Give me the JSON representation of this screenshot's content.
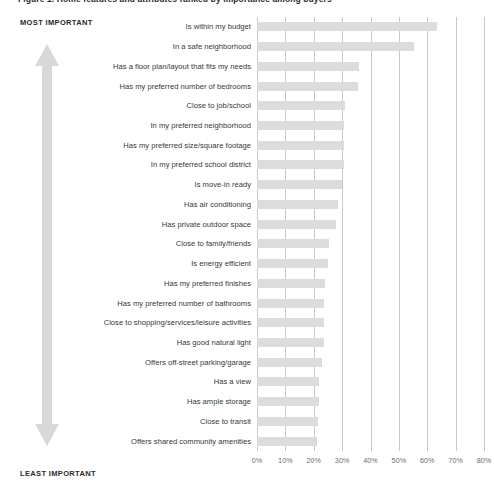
{
  "chart_title": "Figure 1. Home features and attributes ranked by importance among buyers",
  "importance_axis": {
    "top_label": "MOST IMPORTANT",
    "bottom_label": "LEAST IMPORTANT",
    "arrow_icon": "double-headed-vertical-arrow-icon",
    "arrow_color": "#d8d8d8"
  },
  "style": {
    "bar_color": "#dcdcdc",
    "gridline_color": "#c9c9c9",
    "label_color": "#33373b",
    "tick_color": "#6d6d6d",
    "background": "#ffffff"
  },
  "chart_data": {
    "type": "bar",
    "orientation": "horizontal",
    "title": "Figure 1. Home features and attributes ranked by importance among buyers",
    "xlabel": "",
    "ylabel": "",
    "xlim": [
      0,
      80
    ],
    "xticks": [
      0,
      10,
      20,
      30,
      40,
      50,
      60,
      70,
      80
    ],
    "xtick_labels": [
      "0%",
      "10%",
      "20%",
      "30%",
      "40%",
      "50%",
      "60%",
      "70%",
      "80%"
    ],
    "grid": true,
    "legend": false,
    "value_unit": "%",
    "sorted": "descending",
    "categories": [
      "Is within my budget",
      "In a safe neighborhood",
      "Has a floor plan/layout that fits my needs",
      "Has my preferred number of bedrooms",
      "Close to job/school",
      "In my preferred neighborhood",
      "Has my preferred size/square footage",
      "In my preferred school district",
      "Is move-in ready",
      "Has air conditioning",
      "Has private outdoor space",
      "Close to family/friends",
      "Is energy efficient",
      "Has my preferred finishes",
      "Has my preferred number of bathrooms",
      "Close to shopping/services/leisure activities",
      "Has good natural light",
      "Offers off-street parking/garage",
      "Has a view",
      "Has ample storage",
      "Close to transit",
      "Offers shared community amenities"
    ],
    "values": [
      63.5,
      55.5,
      36,
      35.5,
      31,
      30.5,
      30.5,
      30.5,
      30,
      28.5,
      28,
      25.5,
      25,
      24,
      23.5,
      23.5,
      23.5,
      23,
      22,
      22,
      21.5,
      21
    ]
  }
}
